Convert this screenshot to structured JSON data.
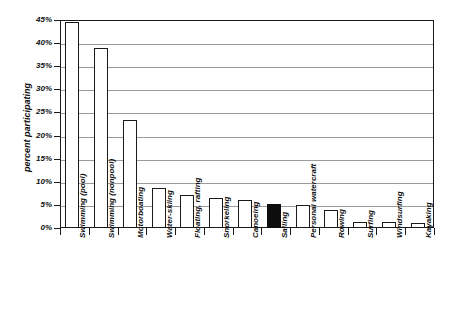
{
  "chart_data": {
    "type": "bar",
    "title": "",
    "xlabel": "",
    "ylabel": "percent participating",
    "ylim": [
      0,
      45
    ],
    "ytick_step": 5,
    "grid": true,
    "legend": null,
    "highlight_category": "Sailing",
    "highlight_color": "#0d0d0d",
    "bar_color": "#ffffff",
    "bar_edge_color": "#1a1a1a",
    "categories": [
      "Swimming (pool)",
      "Swimming (nonpool)",
      "Motorboating",
      "Water-skiing",
      "Floating, rafting",
      "Snorkeling",
      "Canoeing",
      "Sailing",
      "Personal watercraft",
      "Rowing",
      "Surfing",
      "Windsurfing",
      "Kayaking"
    ],
    "values": [
      44.5,
      39.0,
      23.4,
      8.7,
      7.2,
      6.6,
      6.1,
      5.1,
      4.9,
      3.9,
      1.3,
      1.2,
      1.0
    ],
    "ytick_labels": [
      "0%",
      "5%",
      "10%",
      "15%",
      "20%",
      "25%",
      "30%",
      "35%",
      "40%",
      "45%"
    ],
    "ytick_values": [
      0,
      5,
      10,
      15,
      20,
      25,
      30,
      35,
      40,
      45
    ]
  }
}
